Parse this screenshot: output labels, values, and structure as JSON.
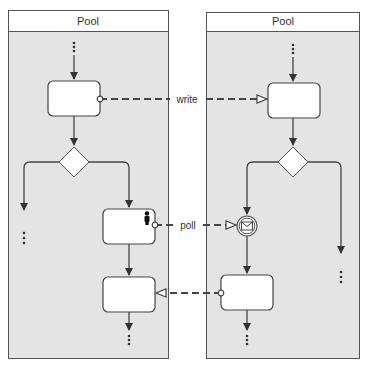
{
  "diagram": {
    "pools": [
      {
        "id": "pool-left",
        "title": "Pool"
      },
      {
        "id": "pool-right",
        "title": "Pool"
      }
    ],
    "message_flows": [
      {
        "label": "write",
        "from": "left-task-1",
        "to": "right-task-1"
      },
      {
        "label": "poll",
        "from": "left-user-task",
        "to": "right-message-event"
      },
      {
        "label": "",
        "from": "right-task-2",
        "to": "left-task-3"
      }
    ],
    "icons": {
      "user": "user-icon",
      "message": "envelope-icon"
    },
    "colors": {
      "pool_fill": "#e4e4e4",
      "stroke": "#444444",
      "task_fill": "#ffffff"
    }
  }
}
